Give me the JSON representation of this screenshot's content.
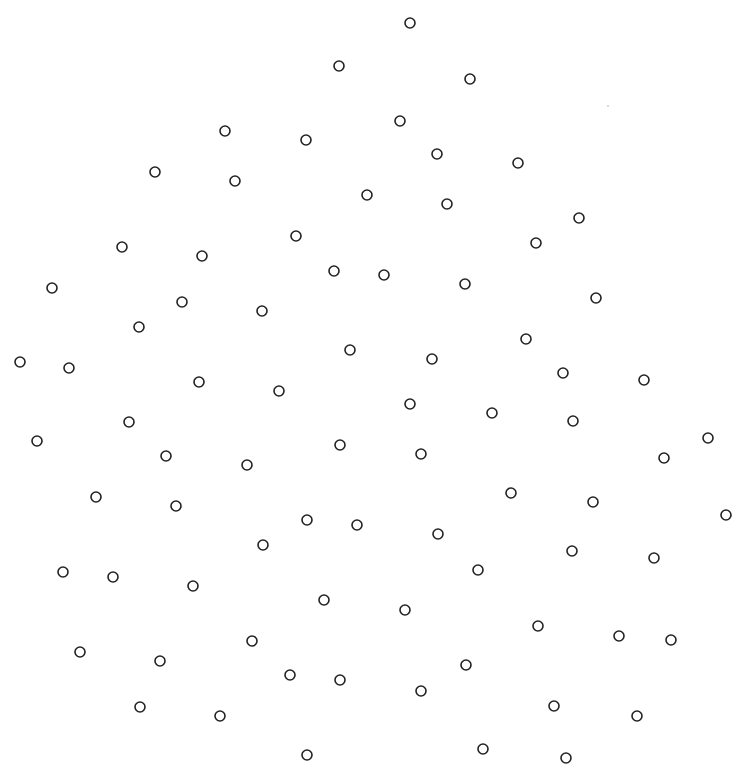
{
  "figure": {
    "width": 753,
    "height": 775,
    "background": "#ffffff",
    "dot_stroke": "#222222",
    "dot_radius": 5,
    "dot_stroke_width": 1.6,
    "speck": {
      "x": 608,
      "y": 106
    },
    "dots": [
      {
        "x": 410,
        "y": 23
      },
      {
        "x": 339,
        "y": 66
      },
      {
        "x": 470,
        "y": 79
      },
      {
        "x": 225,
        "y": 131
      },
      {
        "x": 306,
        "y": 140
      },
      {
        "x": 400,
        "y": 121
      },
      {
        "x": 437,
        "y": 154
      },
      {
        "x": 518,
        "y": 163
      },
      {
        "x": 155,
        "y": 172
      },
      {
        "x": 235,
        "y": 181
      },
      {
        "x": 367,
        "y": 195
      },
      {
        "x": 447,
        "y": 204
      },
      {
        "x": 579,
        "y": 218
      },
      {
        "x": 122,
        "y": 247
      },
      {
        "x": 202,
        "y": 256
      },
      {
        "x": 296,
        "y": 236
      },
      {
        "x": 536,
        "y": 243
      },
      {
        "x": 52,
        "y": 288
      },
      {
        "x": 334,
        "y": 271
      },
      {
        "x": 384,
        "y": 275
      },
      {
        "x": 465,
        "y": 284
      },
      {
        "x": 182,
        "y": 302
      },
      {
        "x": 262,
        "y": 311
      },
      {
        "x": 596,
        "y": 298
      },
      {
        "x": 139,
        "y": 327
      },
      {
        "x": 526,
        "y": 339
      },
      {
        "x": 20,
        "y": 362
      },
      {
        "x": 69,
        "y": 368
      },
      {
        "x": 350,
        "y": 350
      },
      {
        "x": 432,
        "y": 359
      },
      {
        "x": 563,
        "y": 373
      },
      {
        "x": 199,
        "y": 382
      },
      {
        "x": 279,
        "y": 391
      },
      {
        "x": 644,
        "y": 380
      },
      {
        "x": 410,
        "y": 404
      },
      {
        "x": 492,
        "y": 413
      },
      {
        "x": 129,
        "y": 422
      },
      {
        "x": 573,
        "y": 421
      },
      {
        "x": 37,
        "y": 441
      },
      {
        "x": 340,
        "y": 445
      },
      {
        "x": 708,
        "y": 438
      },
      {
        "x": 166,
        "y": 456
      },
      {
        "x": 247,
        "y": 465
      },
      {
        "x": 421,
        "y": 454
      },
      {
        "x": 664,
        "y": 458
      },
      {
        "x": 96,
        "y": 497
      },
      {
        "x": 176,
        "y": 506
      },
      {
        "x": 511,
        "y": 493
      },
      {
        "x": 593,
        "y": 502
      },
      {
        "x": 726,
        "y": 515
      },
      {
        "x": 307,
        "y": 520
      },
      {
        "x": 357,
        "y": 525
      },
      {
        "x": 438,
        "y": 534
      },
      {
        "x": 263,
        "y": 545
      },
      {
        "x": 572,
        "y": 551
      },
      {
        "x": 654,
        "y": 558
      },
      {
        "x": 63,
        "y": 572
      },
      {
        "x": 113,
        "y": 577
      },
      {
        "x": 478,
        "y": 570
      },
      {
        "x": 193,
        "y": 586
      },
      {
        "x": 324,
        "y": 600
      },
      {
        "x": 405,
        "y": 610
      },
      {
        "x": 538,
        "y": 626
      },
      {
        "x": 619,
        "y": 636
      },
      {
        "x": 671,
        "y": 640
      },
      {
        "x": 252,
        "y": 641
      },
      {
        "x": 80,
        "y": 652
      },
      {
        "x": 160,
        "y": 661
      },
      {
        "x": 466,
        "y": 665
      },
      {
        "x": 290,
        "y": 675
      },
      {
        "x": 340,
        "y": 680
      },
      {
        "x": 421,
        "y": 691
      },
      {
        "x": 140,
        "y": 707
      },
      {
        "x": 220,
        "y": 716
      },
      {
        "x": 554,
        "y": 706
      },
      {
        "x": 637,
        "y": 716
      },
      {
        "x": 307,
        "y": 755
      },
      {
        "x": 483,
        "y": 749
      },
      {
        "x": 566,
        "y": 758
      }
    ]
  }
}
